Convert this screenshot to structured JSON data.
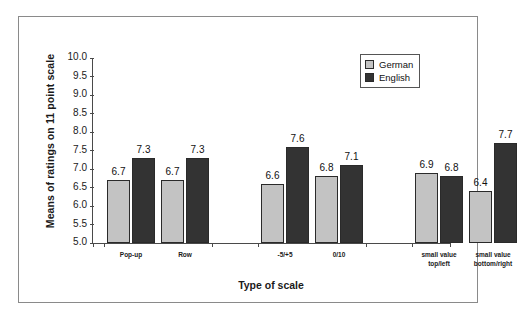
{
  "chart_data": {
    "type": "bar",
    "title": "",
    "xlabel": "Type of scale",
    "ylabel": "Means of ratings on 11 point scale",
    "ylim": [
      5.0,
      10.0
    ],
    "ytick_step": 0.5,
    "yticks": [
      "10.0",
      "9.5",
      "9.0",
      "8.5",
      "8.0",
      "7.5",
      "7.0",
      "6.5",
      "6.0",
      "5.5",
      "5.0"
    ],
    "grid": false,
    "legend_position": "top-right",
    "categories": [
      "Pop-up",
      "Row",
      "-5/+5",
      "0/10",
      "small value\ntop/left",
      "small value\nbottom/right"
    ],
    "category_lines": [
      [
        "Pop-up"
      ],
      [
        "Row"
      ],
      [
        "-5/+5"
      ],
      [
        "0/10"
      ],
      [
        "small value",
        "top/left"
      ],
      [
        "small value",
        "bottom/right"
      ]
    ],
    "group_breaks": [
      2,
      4
    ],
    "series": [
      {
        "name": "German",
        "color": "#c3c3c3",
        "values": [
          6.7,
          6.7,
          6.6,
          6.8,
          6.9,
          6.4
        ],
        "labels": [
          "6.7",
          "6.7",
          "6.6",
          "6.8",
          "6.9",
          "6.4"
        ]
      },
      {
        "name": "English",
        "color": "#333333",
        "values": [
          7.3,
          7.3,
          7.6,
          7.1,
          6.8,
          7.7
        ],
        "labels": [
          "7.3",
          "7.3",
          "7.6",
          "7.1",
          "6.8",
          "7.7"
        ]
      }
    ]
  },
  "legend": {
    "items": [
      {
        "label": "German",
        "swatch": "german"
      },
      {
        "label": "English",
        "swatch": "english"
      }
    ]
  }
}
